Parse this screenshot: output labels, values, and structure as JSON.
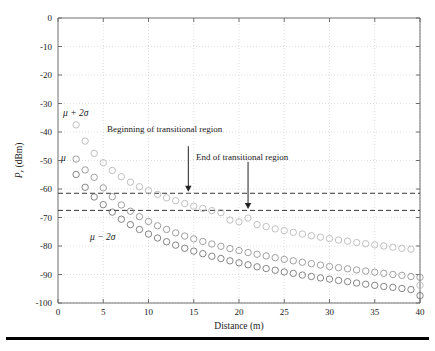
{
  "figure": {
    "bottom_rule_color": "#000000"
  },
  "axes": {
    "x_title": "Distance (m)",
    "y_title_main": "P",
    "y_title_sub": "r",
    "y_title_unit": "(dBm)",
    "x_ticks": [
      "0",
      "5",
      "10",
      "15",
      "20",
      "25",
      "30",
      "35",
      "40"
    ],
    "y_ticks": [
      "0",
      "-10",
      "-20",
      "-30",
      "-40",
      "-50",
      "-60",
      "-70",
      "-80",
      "-90",
      "-100"
    ]
  },
  "annotations": {
    "begin_label": "Beginning of transitional region",
    "end_label": "End of transitional region",
    "mu_plus_2sigma": "μ + 2σ",
    "mu": "μ",
    "mu_minus_2sigma": "μ − 2σ"
  },
  "chart_data": {
    "type": "scatter",
    "title": "",
    "xlabel": "Distance (m)",
    "ylabel": "P_r (dBm)",
    "xlim": [
      0,
      40
    ],
    "ylim": [
      -100,
      0
    ],
    "xticks": [
      0,
      5,
      10,
      15,
      20,
      25,
      30,
      35,
      40
    ],
    "yticks": [
      0,
      -10,
      -20,
      -30,
      -40,
      -50,
      -60,
      -70,
      -80,
      -90,
      -100
    ],
    "grid": true,
    "legend": "none",
    "marker": "open-circle",
    "marker_size": 3.2,
    "threshold_lines": [
      {
        "name": "begin-transitional-threshold",
        "y": -61.5,
        "style": "dashed",
        "color": "#333333"
      },
      {
        "name": "end-transitional-threshold",
        "y": -67.5,
        "style": "dashed",
        "color": "#333333"
      }
    ],
    "arrows": [
      {
        "name": "beginning-of-transitional-region",
        "x": 14.4,
        "y_from": -45.0,
        "y_to": -61.0,
        "label": "Beginning of transitional region"
      },
      {
        "name": "end-of-transitional-region",
        "x": 21.0,
        "y_from": -50.5,
        "y_to": -67.0,
        "label": "End of transitional region"
      }
    ],
    "series": [
      {
        "name": "mu + 2sigma",
        "color": "#b5b5b5",
        "x": [
          2,
          3,
          4,
          5,
          6,
          7,
          8,
          9,
          10,
          11,
          12,
          13,
          14,
          15,
          16,
          17,
          18,
          19,
          20,
          21,
          22,
          23,
          24,
          25,
          26,
          27,
          28,
          29,
          30,
          31,
          32,
          33,
          34,
          35,
          36,
          37,
          38,
          39,
          40
        ],
        "y": [
          -37.5,
          -43.2,
          -47.5,
          -50.8,
          -53.5,
          -55.7,
          -57.6,
          -59.2,
          -60.6,
          -61.9,
          -63.1,
          -64.1,
          -65.1,
          -66.0,
          -66.8,
          -67.6,
          -68.3,
          -70.9,
          -71.5,
          -70.2,
          -72.5,
          -73.2,
          -74.0,
          -74.6,
          -75.2,
          -75.8,
          -76.4,
          -76.9,
          -77.4,
          -77.9,
          -78.3,
          -78.8,
          -79.2,
          -79.6,
          -80.0,
          -80.4,
          -80.8,
          -81.1,
          -93.8
        ]
      },
      {
        "name": "mu",
        "color": "#8f8f8f",
        "x": [
          2,
          3,
          4,
          5,
          6,
          7,
          8,
          9,
          10,
          11,
          12,
          13,
          14,
          15,
          16,
          17,
          18,
          19,
          20,
          21,
          22,
          23,
          24,
          25,
          26,
          27,
          28,
          29,
          30,
          31,
          32,
          33,
          34,
          35,
          36,
          37,
          38,
          39,
          40
        ],
        "y": [
          -49.5,
          -53.3,
          -55.9,
          -59.6,
          -62.7,
          -65.6,
          -67.8,
          -69.7,
          -71.4,
          -72.9,
          -74.2,
          -75.4,
          -76.5,
          -77.5,
          -78.4,
          -79.3,
          -80.1,
          -80.9,
          -81.6,
          -82.3,
          -82.9,
          -83.5,
          -84.1,
          -84.7,
          -85.2,
          -85.7,
          -86.2,
          -86.7,
          -87.2,
          -87.6,
          -88.0,
          -88.4,
          -88.8,
          -89.2,
          -89.6,
          -90.0,
          -90.3,
          -90.7,
          -91.0
        ]
      },
      {
        "name": "mu - 2sigma",
        "color": "#6f6f6f",
        "x": [
          2,
          3,
          4,
          5,
          6,
          7,
          8,
          9,
          10,
          11,
          12,
          13,
          14,
          15,
          16,
          17,
          18,
          19,
          20,
          21,
          22,
          23,
          24,
          25,
          26,
          27,
          28,
          29,
          30,
          31,
          32,
          33,
          34,
          35,
          36,
          37,
          38,
          39,
          40
        ],
        "y": [
          -54.9,
          -59.4,
          -62.8,
          -65.5,
          -68.1,
          -70.6,
          -72.5,
          -74.2,
          -75.8,
          -77.2,
          -78.5,
          -79.7,
          -80.8,
          -81.8,
          -82.7,
          -83.6,
          -84.4,
          -85.2,
          -85.9,
          -86.6,
          -87.3,
          -87.9,
          -88.5,
          -89.1,
          -89.6,
          -90.2,
          -90.7,
          -91.2,
          -91.6,
          -92.1,
          -92.5,
          -93.0,
          -93.4,
          -93.8,
          -94.2,
          -94.5,
          -94.9,
          -95.3,
          -97.4
        ]
      }
    ]
  }
}
